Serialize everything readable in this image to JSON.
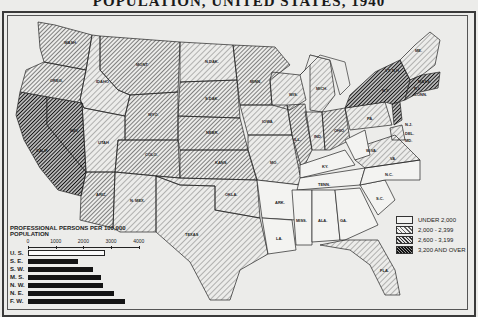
{
  "title": "POPULATION, UNITED STATES, 1940",
  "legend": {
    "items": [
      {
        "label": "UNDER 2,000",
        "pattern": "none"
      },
      {
        "label": "2,000 - 2,399",
        "pattern": "light-hatch"
      },
      {
        "label": "2,600 - 3,199",
        "pattern": "medium-hatch"
      },
      {
        "label": "3,200 AND OVER",
        "pattern": "dense-hatch"
      }
    ]
  },
  "state_labels": [
    "WASH.",
    "OREG.",
    "CALIF.",
    "NEV.",
    "IDAHO",
    "MONT.",
    "WYO.",
    "UTAH",
    "ARIZ.",
    "COLO.",
    "N. MEX.",
    "N.DAK.",
    "S.DAK.",
    "NEBR.",
    "KANS.",
    "OKLA.",
    "TEXAS",
    "MINN.",
    "IOWA",
    "MO.",
    "ARK.",
    "LA.",
    "WIS.",
    "MICH.",
    "ILL.",
    "IND.",
    "OHIO",
    "KY.",
    "TENN.",
    "MISS.",
    "ALA.",
    "GA.",
    "FLA.",
    "S.C.",
    "N.C.",
    "VA.",
    "W.VA.",
    "PA.",
    "N.Y.",
    "N.J.",
    "DEL.",
    "MD.",
    "VT.",
    "N.H.",
    "ME.",
    "MASS.",
    "R.I.",
    "CONN."
  ],
  "chart_data": {
    "type": "bar",
    "title": "PROFESSIONAL PERSONS PER 100,000 POPULATION",
    "orientation": "horizontal",
    "categories": [
      "U. S.",
      "S. E.",
      "S. W.",
      "M. S.",
      "N. W.",
      "N. E.",
      "F. W."
    ],
    "values": [
      2700,
      1800,
      2350,
      2650,
      2700,
      3100,
      3500
    ],
    "xlabel": "",
    "ylabel": "",
    "xlim": [
      0,
      4000
    ],
    "ticks": [
      "0",
      "1000",
      "2000",
      "3000",
      "4000"
    ],
    "grid": false,
    "highlight": {
      "U. S.": "outline"
    }
  }
}
